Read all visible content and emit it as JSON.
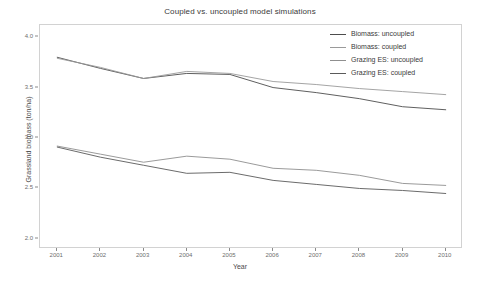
{
  "chart_data": {
    "type": "line",
    "title": "Coupled vs. uncoupled model simulations",
    "xlabel": "Year",
    "ylabel": "Grassland biomass (ton/ha)",
    "x": [
      2001,
      2002,
      2003,
      2004,
      2005,
      2006,
      2007,
      2008,
      2009,
      2010
    ],
    "xtick_labels": [
      "2001",
      "2002",
      "2003",
      "2004",
      "2005",
      "2006",
      "2007",
      "2008",
      "2009",
      "2010"
    ],
    "ytick_labels": [
      "2.0",
      "2.5",
      "3.0",
      "3.5",
      "4.0"
    ],
    "ytick_values": [
      2.0,
      2.5,
      3.0,
      3.5,
      4.0
    ],
    "ylim": [
      1.9,
      4.12
    ],
    "xlim": [
      2000.6,
      2010.4
    ],
    "grid": false,
    "legend_position": "top-right",
    "series": [
      {
        "name": "Biomass: uncoupled",
        "color": "#4d4d4d",
        "values": [
          3.8,
          3.69,
          3.59,
          3.64,
          3.63,
          3.5,
          3.45,
          3.39,
          3.31,
          3.28
        ]
      },
      {
        "name": "Biomass: coupled",
        "color": "#9a9a9a",
        "values": [
          3.79,
          3.7,
          3.59,
          3.66,
          3.64,
          3.56,
          3.53,
          3.49,
          3.46,
          3.43
        ]
      },
      {
        "name": "Grazing ES: uncoupled",
        "color": "#8f8f8f",
        "values": [
          2.92,
          2.84,
          2.76,
          2.82,
          2.79,
          2.7,
          2.68,
          2.63,
          2.55,
          2.53
        ]
      },
      {
        "name": "Grazing ES: coupled",
        "color": "#5a5a5a",
        "values": [
          2.91,
          2.81,
          2.73,
          2.65,
          2.66,
          2.58,
          2.54,
          2.5,
          2.48,
          2.45
        ]
      }
    ]
  },
  "legend": {
    "items": [
      {
        "label": "Biomass: uncoupled"
      },
      {
        "label": "Biomass: coupled"
      },
      {
        "label": "Grazing ES: uncoupled"
      },
      {
        "label": "Grazing ES: coupled"
      }
    ]
  }
}
